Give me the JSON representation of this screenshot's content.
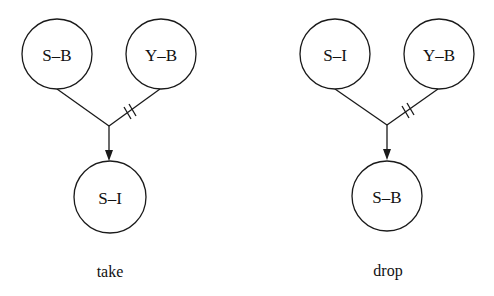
{
  "diagrams": [
    {
      "caption": "take",
      "nodes": {
        "top_left": "S–B",
        "top_right": "Y–B",
        "bottom": "S–I"
      },
      "blocked_edge": "top_right"
    },
    {
      "caption": "drop",
      "nodes": {
        "top_left": "S–I",
        "top_right": "Y–B",
        "bottom": "S–B"
      },
      "blocked_edge": "top_right"
    }
  ]
}
